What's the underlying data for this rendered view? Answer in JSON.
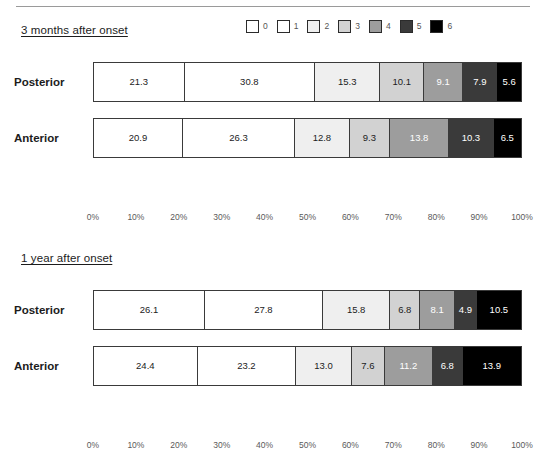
{
  "top_rule": true,
  "legend": {
    "items": [
      {
        "label": "0",
        "color": "#ffffff"
      },
      {
        "label": "1",
        "color": "#ffffff"
      },
      {
        "label": "2",
        "color": "#efefef"
      },
      {
        "label": "3",
        "color": "#d2d2d2"
      },
      {
        "label": "4",
        "color": "#9d9d9d"
      },
      {
        "label": "5",
        "color": "#3a3a3a"
      },
      {
        "label": "6",
        "color": "#000000"
      }
    ]
  },
  "axis": {
    "ticks": [
      "0%",
      "10%",
      "20%",
      "30%",
      "40%",
      "50%",
      "60%",
      "70%",
      "80%",
      "90%",
      "100%"
    ]
  },
  "sections": [
    {
      "title": "3 months after onset",
      "rows": [
        {
          "label": "Posterior",
          "values": [
            21.3,
            30.8,
            15.3,
            10.1,
            9.1,
            7.9,
            5.6
          ]
        },
        {
          "label": "Anterior",
          "values": [
            20.9,
            26.3,
            12.8,
            9.3,
            13.8,
            10.3,
            6.5
          ]
        }
      ]
    },
    {
      "title": "1 year after onset",
      "rows": [
        {
          "label": "Posterior",
          "values": [
            26.1,
            27.8,
            15.8,
            6.8,
            8.1,
            4.9,
            10.5
          ]
        },
        {
          "label": "Anterior",
          "values": [
            24.4,
            23.2,
            13.0,
            7.6,
            11.2,
            6.8,
            13.9
          ]
        }
      ]
    }
  ],
  "chart_data": {
    "type": "bar",
    "title": "",
    "subtitle": "",
    "orientation": "horizontal",
    "stacked": true,
    "normalized": true,
    "xlabel": "",
    "ylabel": "",
    "xlim": [
      0,
      100
    ],
    "xticks": [
      "0%",
      "10%",
      "20%",
      "30%",
      "40%",
      "50%",
      "60%",
      "70%",
      "80%",
      "90%",
      "100%"
    ],
    "grid": false,
    "legend_position": "top-right",
    "legend_title": "",
    "legend_entries": [
      "0",
      "1",
      "2",
      "3",
      "4",
      "5",
      "6"
    ],
    "series_colors": [
      "#ffffff",
      "#ffffff",
      "#efefef",
      "#d2d2d2",
      "#9d9d9d",
      "#3a3a3a",
      "#000000"
    ],
    "panels": [
      {
        "panel_title": "3 months after onset",
        "categories": [
          "Posterior",
          "Anterior"
        ],
        "series": [
          {
            "name": "0",
            "values": [
              21.3,
              20.9
            ]
          },
          {
            "name": "1",
            "values": [
              30.8,
              26.3
            ]
          },
          {
            "name": "2",
            "values": [
              15.3,
              12.8
            ]
          },
          {
            "name": "3",
            "values": [
              10.1,
              9.3
            ]
          },
          {
            "name": "4",
            "values": [
              9.1,
              13.8
            ]
          },
          {
            "name": "5",
            "values": [
              7.9,
              10.3
            ]
          },
          {
            "name": "6",
            "values": [
              5.6,
              6.5
            ]
          }
        ]
      },
      {
        "panel_title": "1 year after onset",
        "categories": [
          "Posterior",
          "Anterior"
        ],
        "series": [
          {
            "name": "0",
            "values": [
              26.1,
              24.4
            ]
          },
          {
            "name": "1",
            "values": [
              27.8,
              23.2
            ]
          },
          {
            "name": "2",
            "values": [
              15.8,
              13.0
            ]
          },
          {
            "name": "3",
            "values": [
              6.8,
              7.6
            ]
          },
          {
            "name": "4",
            "values": [
              8.1,
              11.2
            ]
          },
          {
            "name": "5",
            "values": [
              4.9,
              6.8
            ]
          },
          {
            "name": "6",
            "values": [
              10.5,
              13.9
            ]
          }
        ]
      }
    ]
  }
}
